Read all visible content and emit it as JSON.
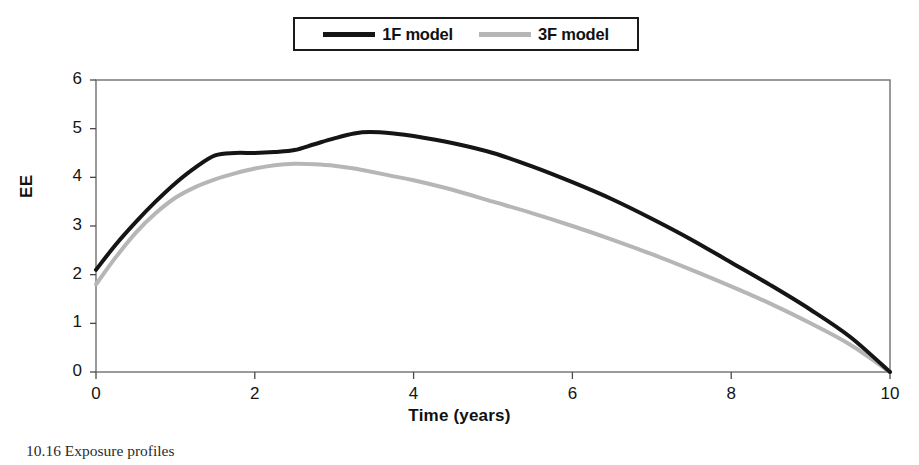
{
  "figure": {
    "caption": "10.16   Exposure profiles"
  },
  "legend": {
    "position": "top-center",
    "entries": [
      {
        "label": "1F model",
        "color": "#151515",
        "swatch": "line-swatch-black"
      },
      {
        "label": "3F model",
        "color": "#b6b6b6",
        "swatch": "line-swatch-gray"
      }
    ]
  },
  "axes": {
    "y_title": "EE",
    "x_title": "Time (years)",
    "y_ticks": [
      "0",
      "1",
      "2",
      "3",
      "4",
      "5",
      "6"
    ],
    "x_ticks": [
      "0",
      "2",
      "4",
      "6",
      "8",
      "10"
    ]
  },
  "chart_data": {
    "type": "line",
    "title": "",
    "xlabel": "Time (years)",
    "ylabel": "EE",
    "xlim": [
      0,
      10
    ],
    "ylim": [
      0,
      6
    ],
    "xtick_step": 2,
    "ytick_step": 1,
    "grid": false,
    "legend_position": "top-center",
    "x": [
      0.0,
      0.25,
      0.5,
      0.75,
      1.0,
      1.25,
      1.5,
      1.75,
      2.0,
      2.25,
      2.5,
      2.75,
      3.0,
      3.25,
      3.45,
      3.75,
      4.0,
      4.5,
      5.0,
      5.5,
      6.0,
      6.5,
      7.0,
      7.5,
      8.0,
      8.5,
      9.0,
      9.5,
      10.0
    ],
    "series": [
      {
        "name": "1F model",
        "color": "#151515",
        "width": 4,
        "values": [
          2.1,
          2.62,
          3.08,
          3.5,
          3.88,
          4.2,
          4.45,
          4.5,
          4.5,
          4.52,
          4.56,
          4.68,
          4.8,
          4.9,
          4.93,
          4.9,
          4.85,
          4.7,
          4.5,
          4.22,
          3.9,
          3.55,
          3.15,
          2.72,
          2.25,
          1.78,
          1.28,
          0.72,
          0.0
        ]
      },
      {
        "name": "3F model",
        "color": "#b6b6b6",
        "width": 4,
        "values": [
          1.8,
          2.36,
          2.86,
          3.26,
          3.58,
          3.8,
          3.96,
          4.08,
          4.18,
          4.25,
          4.28,
          4.27,
          4.24,
          4.18,
          4.12,
          4.02,
          3.94,
          3.74,
          3.5,
          3.26,
          3.0,
          2.72,
          2.42,
          2.1,
          1.76,
          1.4,
          1.0,
          0.56,
          0.0
        ]
      }
    ]
  },
  "colors": {
    "frame": "#6b6b6b",
    "axis": "#4a4a4a",
    "series_1f": "#151515",
    "series_3f": "#b6b6b6",
    "background": "#ffffff"
  }
}
